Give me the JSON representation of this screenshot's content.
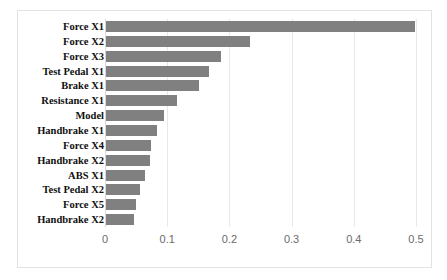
{
  "chart_data": {
    "type": "bar",
    "orientation": "horizontal",
    "title": "",
    "xlabel": "",
    "ylabel": "",
    "xlim": [
      0,
      0.5
    ],
    "xticks": [
      "0",
      "0.1",
      "0.2",
      "0.3",
      "0.4",
      "0.5"
    ],
    "xtick_values": [
      0,
      0.1,
      0.2,
      0.3,
      0.4,
      0.5
    ],
    "grid": true,
    "legend": false,
    "bar_color": "#808080",
    "categories": [
      "Force X1",
      "Force X2",
      "Force X3",
      "Test Pedal X1",
      "Brake X1",
      "Resistance X1",
      "Model",
      "Handbrake X1",
      "Force X4",
      "Handbrake X2",
      "ABS X1",
      "Test Pedal X2",
      "Force X5",
      "Handbrake X2"
    ],
    "values": [
      0.497,
      0.231,
      0.185,
      0.165,
      0.15,
      0.114,
      0.094,
      0.082,
      0.073,
      0.07,
      0.062,
      0.055,
      0.048,
      0.045
    ]
  }
}
